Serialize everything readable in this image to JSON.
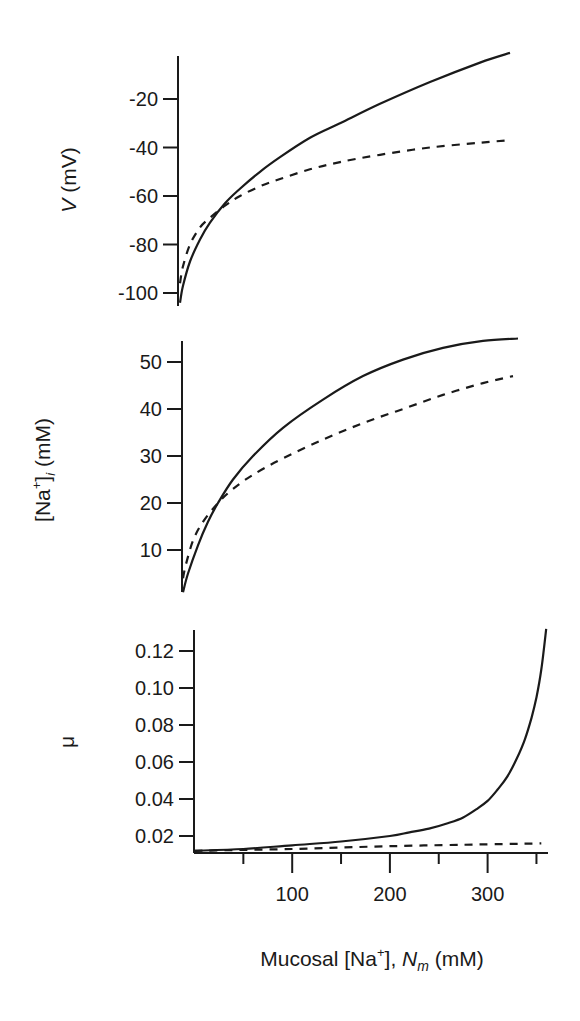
{
  "chart_data": [
    {
      "type": "line",
      "panel": "top",
      "ylabel": "V (mV)",
      "ylabel_italic": "V",
      "ylabel_rest": " (mV)",
      "yticks": [
        -20,
        -40,
        -60,
        -80,
        -100
      ],
      "ylim": [
        -105,
        2
      ],
      "xlim": [
        0,
        330
      ],
      "series": [
        {
          "name": "solid",
          "style": "solid",
          "x": [
            0,
            3,
            10,
            20,
            30,
            45,
            60,
            80,
            100,
            130,
            160,
            200,
            250,
            300,
            330
          ],
          "y": [
            -104,
            -97,
            -87,
            -78,
            -71,
            -63,
            -57,
            -50,
            -44,
            -36,
            -30,
            -22,
            -13,
            -5,
            -1
          ]
        },
        {
          "name": "dashed",
          "style": "dashed",
          "x": [
            0,
            3,
            10,
            20,
            30,
            45,
            60,
            80,
            100,
            130,
            160,
            200,
            250,
            300,
            330
          ],
          "y": [
            -96,
            -89,
            -80,
            -73,
            -69,
            -64,
            -60,
            -56,
            -53,
            -49,
            -46,
            -43,
            -40,
            -38,
            -37
          ]
        }
      ]
    },
    {
      "type": "line",
      "panel": "middle",
      "ylabel": "[Na+]i (mM)",
      "ylabel_parts": {
        "open": "[Na",
        "sup": "+",
        "close": "]",
        "sub": "i",
        "unit": " (mM)"
      },
      "yticks": [
        50,
        40,
        30,
        20,
        10
      ],
      "ylim": [
        1,
        56
      ],
      "xlim": [
        0,
        335
      ],
      "series": [
        {
          "name": "solid",
          "style": "solid",
          "x": [
            0,
            5,
            15,
            25,
            35,
            50,
            70,
            100,
            140,
            180,
            220,
            260,
            300,
            335
          ],
          "y": [
            1,
            5,
            11,
            16,
            20,
            25,
            30,
            36,
            42,
            47,
            50.5,
            53,
            54.5,
            55
          ]
        },
        {
          "name": "dashed",
          "style": "dashed",
          "x": [
            0,
            3,
            10,
            20,
            35,
            50,
            70,
            100,
            140,
            180,
            220,
            260,
            300,
            330
          ],
          "y": [
            4,
            7,
            12,
            16,
            20,
            23,
            26,
            29.5,
            33.5,
            37,
            40,
            43,
            45.5,
            47
          ]
        }
      ]
    },
    {
      "type": "line",
      "panel": "bottom",
      "ylabel": "μ",
      "yticks": [
        0.12,
        0.1,
        0.08,
        0.06,
        0.04,
        0.02
      ],
      "ytick_labels": [
        "0.12",
        "0.10",
        "0.08",
        "0.06",
        "0.04",
        "0.02"
      ],
      "ylim": [
        0.011,
        0.131
      ],
      "xlim": [
        0,
        360
      ],
      "xticks_major": [
        100,
        200,
        300
      ],
      "xticks_minor": [
        50,
        150,
        250,
        350
      ],
      "xlabel": "Mucosal [Na+], Nm (mM)",
      "xlabel_parts": {
        "pre": "Mucosal [Na",
        "sup": "+",
        "mid": "], ",
        "italic": "N",
        "sub": "m",
        "unit": " (mM)"
      },
      "series": [
        {
          "name": "solid",
          "style": "solid",
          "x": [
            0,
            50,
            100,
            150,
            200,
            220,
            240,
            260,
            275,
            290,
            300,
            310,
            320,
            330,
            338,
            345,
            350,
            355,
            360
          ],
          "y": [
            0.012,
            0.013,
            0.015,
            0.017,
            0.02,
            0.022,
            0.024,
            0.027,
            0.03,
            0.035,
            0.039,
            0.045,
            0.052,
            0.062,
            0.072,
            0.084,
            0.095,
            0.11,
            0.132
          ]
        },
        {
          "name": "dashed",
          "style": "dashed",
          "x": [
            0,
            100,
            200,
            300,
            355
          ],
          "y": [
            0.012,
            0.013,
            0.0145,
            0.0155,
            0.016
          ]
        }
      ]
    }
  ]
}
